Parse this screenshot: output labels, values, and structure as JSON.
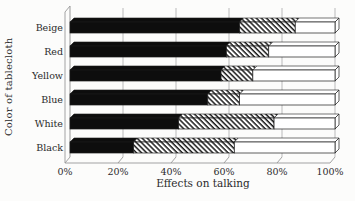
{
  "chart_data": {
    "type": "bar",
    "orientation": "horizontal",
    "stacked": true,
    "effect": "3d",
    "categories": [
      "Beige",
      "Red",
      "Yellow",
      "Blue",
      "White",
      "Black"
    ],
    "series": [
      {
        "name": "solid-black-segment",
        "style": "solid",
        "values": [
          64,
          59,
          57,
          52,
          41,
          24
        ]
      },
      {
        "name": "hatched-segment",
        "style": "hatch",
        "values": [
          21,
          16,
          12,
          12,
          36,
          38
        ]
      },
      {
        "name": "open-white-segment",
        "style": "open",
        "values": [
          15,
          25,
          31,
          36,
          23,
          38
        ]
      }
    ],
    "title": "",
    "xlabel": "Effects on talking",
    "ylabel": "Color of tablecloth",
    "x_ticks": [
      "0%",
      "20%",
      "40%",
      "60%",
      "80%",
      "100%"
    ],
    "x_tick_values": [
      0,
      20,
      40,
      60,
      80,
      100
    ],
    "xlim": [
      0,
      100
    ],
    "grid": true,
    "legend": "none"
  },
  "colors": {
    "background": "#fcfcfb",
    "bar_solid": "#0d0d0d",
    "bar_open": "#ffffff",
    "outline": "#1a1a1a",
    "grid": "#b3b3b3",
    "frame": "#999999",
    "text": "#2b2b2b"
  }
}
